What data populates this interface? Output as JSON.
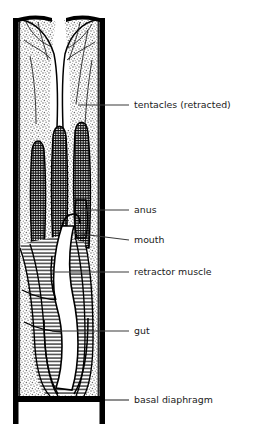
{
  "figure": {
    "background_color": "#ffffff",
    "ink_color": "#000000",
    "label_color": "#1a1a1a",
    "stipple_color": "#9a9a9a",
    "hatch_color": "#111111"
  },
  "labels": [
    {
      "id": "tentacles",
      "text": "tentacles (retracted)",
      "leader_y": 105,
      "text_x": 134,
      "leader_from_x": 100,
      "leader_to_x": 129,
      "anchor_in_specimen_x": 78,
      "anchor_in_specimen_y": 105
    },
    {
      "id": "anus",
      "text": "anus",
      "leader_y": 210,
      "text_x": 134,
      "leader_from_x": 100,
      "leader_to_x": 129,
      "anchor_in_specimen_x": 82,
      "anchor_in_specimen_y": 210
    },
    {
      "id": "mouth",
      "text": "mouth",
      "leader_y": 240,
      "text_x": 134,
      "leader_from_x": 73,
      "leader_to_x": 129,
      "anchor_in_specimen_x": 73,
      "anchor_in_specimen_y": 233
    },
    {
      "id": "retractor-muscle",
      "text": "retractor muscle",
      "leader_y": 272,
      "text_x": 134,
      "leader_from_x": 52,
      "leader_to_x": 129,
      "anchor_in_specimen_x": 52,
      "anchor_in_specimen_y": 272
    },
    {
      "id": "gut",
      "text": "gut",
      "leader_y": 331,
      "text_x": 134,
      "leader_from_x": 52,
      "leader_to_x": 129,
      "anchor_in_specimen_x": 52,
      "anchor_in_specimen_y": 331
    },
    {
      "id": "basal-diaphragm",
      "text": "basal diaphragm",
      "leader_y": 400,
      "text_x": 134,
      "leader_from_x": 105,
      "leader_to_x": 129,
      "anchor_in_specimen_x": 105,
      "anchor_in_specimen_y": 400
    }
  ],
  "anatomy": {
    "tube_wall_left_x": 13,
    "tube_wall_right_x": 100,
    "tube_wall_thickness": 5,
    "tube_top_y": 18,
    "tube_bottom_y": 399,
    "diaphragm_y": 399,
    "diaphragm_leg_bottom_y": 424,
    "lobe_count": 2,
    "tentacle_bundle_count": 3,
    "regions": [
      {
        "name": "flared-lobes",
        "texture": "stipple",
        "y_range": [
          20,
          115
        ]
      },
      {
        "name": "tentacle-bundles",
        "texture": "cross-hatch",
        "y_range": [
          112,
          255
        ]
      },
      {
        "name": "body-wall-tissue",
        "texture": "stipple",
        "y_range": [
          20,
          395
        ]
      },
      {
        "name": "retractor-muscle",
        "texture": "horizontal-hatch",
        "y_range": [
          240,
          395
        ]
      },
      {
        "name": "gut-cavity",
        "texture": "white",
        "y_range": [
          30,
          392
        ]
      }
    ]
  }
}
